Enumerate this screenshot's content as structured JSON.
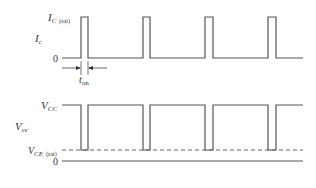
{
  "diagram": {
    "colors": {
      "line": "#555555",
      "text": "#333333",
      "background": "#ffffff"
    },
    "current_waveform": {
      "axis_label": "I",
      "axis_label_sub": "c",
      "top_level_label": "I",
      "top_level_label_sub": "C",
      "top_level_label_suffix": "(sat)",
      "zero_label": "0",
      "pulse_width_label": "t",
      "pulse_width_label_sub": "on",
      "pulses": [
        {
          "x_start": 81,
          "x_end": 88
        },
        {
          "x_start": 143,
          "x_end": 150
        },
        {
          "x_start": 205,
          "x_end": 213
        },
        {
          "x_start": 268,
          "x_end": 276
        }
      ]
    },
    "voltage_waveform": {
      "axis_label": "V",
      "axis_label_sub": "ce",
      "top_level_label": "V",
      "top_level_label_sub": "CC",
      "sat_level_label": "V",
      "sat_level_label_sub": "CE",
      "sat_level_label_suffix": "(sat)",
      "zero_label": "0"
    }
  }
}
